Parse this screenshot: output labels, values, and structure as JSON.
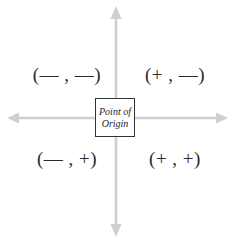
{
  "diagram": {
    "background_color": "#ffffff",
    "axis_color": "#cfcfcf",
    "box_border_color": "#333333",
    "label_color": "#2b2b2b",
    "axes": {
      "horizontal": {
        "name": "horizontal-axis",
        "y": 118,
        "x_start": 8,
        "x_end": 227,
        "arrow_left": true,
        "arrow_right": true
      },
      "vertical": {
        "name": "vertical-axis",
        "x": 116,
        "y_start": 7,
        "y_end": 236,
        "arrow_up": true,
        "arrow_down": true
      }
    },
    "origin_box": {
      "line1": "Point of",
      "line2": "Origin"
    },
    "quadrants": [
      {
        "position": "top-left",
        "label": "(— , —)"
      },
      {
        "position": "top-right",
        "label": "(+ , —)"
      },
      {
        "position": "bottom-left",
        "label": "(— , +)"
      },
      {
        "position": "bottom-right",
        "label": "(+ , +)"
      }
    ]
  }
}
